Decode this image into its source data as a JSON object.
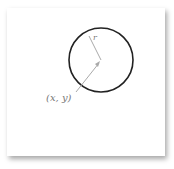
{
  "diagram": {
    "center_label": "(x, y)",
    "radius_label": "r",
    "colors": {
      "circle": "#222222",
      "arrow": "#aaaaaa",
      "text": "#777777"
    }
  }
}
